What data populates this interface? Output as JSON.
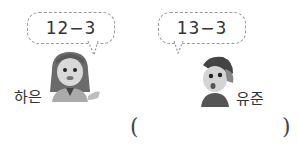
{
  "problem": {
    "bubbles": [
      {
        "speaker": "하은",
        "expression": "12−3"
      },
      {
        "speaker": "유준",
        "expression": "13−3"
      }
    ],
    "characters": [
      {
        "name": "하은",
        "icon": "girl-character-icon"
      },
      {
        "name": "유준",
        "icon": "boy-character-icon"
      }
    ],
    "answer": {
      "open_paren": "(",
      "close_paren": ")",
      "value": ""
    }
  }
}
